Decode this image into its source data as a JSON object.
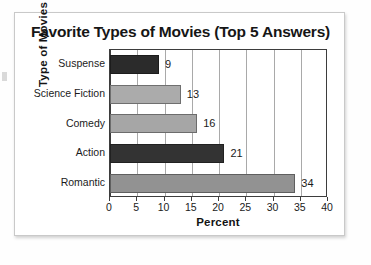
{
  "card": {
    "title": "Favorite Types of Movies (Top 5 Answers)"
  },
  "chart_data": {
    "type": "bar",
    "orientation": "horizontal",
    "title": "Favorite Types of Movies (Top 5 Answers)",
    "xlabel": "Percent",
    "ylabel": "Type of Movies",
    "categories": [
      "Suspense",
      "Science Fiction",
      "Comedy",
      "Action",
      "Romantic"
    ],
    "values": [
      9,
      13,
      16,
      21,
      34
    ],
    "bar_colors": [
      "#2b2b2b",
      "#ababab",
      "#a6a6a6",
      "#333333",
      "#929292"
    ],
    "value_labels": [
      "9",
      "13",
      "16",
      "21",
      "34"
    ],
    "xlim": [
      0,
      40
    ],
    "xticks": [
      0,
      5,
      10,
      15,
      20,
      25,
      30,
      35,
      40
    ],
    "xtick_labels": [
      "0",
      "5",
      "10",
      "15",
      "20",
      "25",
      "30",
      "35",
      "40"
    ],
    "grid": "vertical",
    "legend": "none"
  },
  "colors": {
    "axis": "#3d3d3d",
    "grid": "#a9a9a9",
    "text": "#1b1b1b",
    "card_border": "#c9c9c9"
  }
}
